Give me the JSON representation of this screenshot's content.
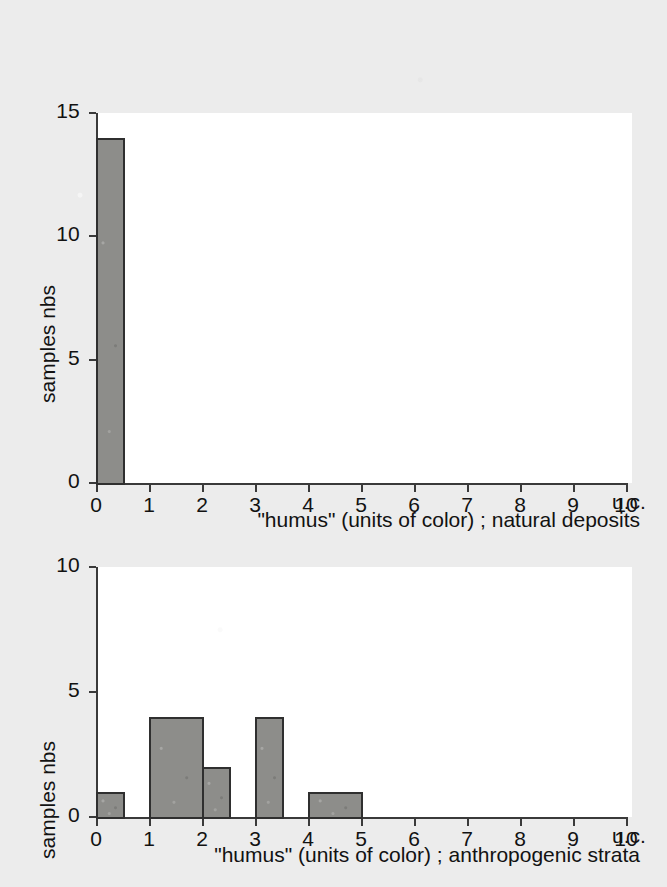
{
  "figure": {
    "background_color": "#ececec",
    "bar_fill_color": "#8d8d8a",
    "bar_edge_color": "#2f2f2f",
    "axis_color": "#3a3a3a"
  },
  "charts": [
    {
      "id": "natural-deposits",
      "ylabel": "samples nbs",
      "xlabel": "\"humus\" (units of color) ; natural deposits",
      "x_unit_suffix": "u.c.",
      "yticks": [
        "0",
        "5",
        "10",
        "15"
      ],
      "ytick_values": [
        0,
        5,
        10,
        15
      ],
      "xticks": [
        "0",
        "1",
        "2",
        "3",
        "4",
        "5",
        "6",
        "7",
        "8",
        "9",
        "10"
      ],
      "xtick_values": [
        0,
        1,
        2,
        3,
        4,
        5,
        6,
        7,
        8,
        9,
        10
      ],
      "bars": [
        {
          "x0": 0,
          "x1": 0.5,
          "value": 14
        }
      ]
    },
    {
      "id": "anthropogenic-strata",
      "ylabel": "samples nbs",
      "xlabel": "\"humus\" (units of color) ; anthropogenic strata",
      "x_unit_suffix": "u.c.",
      "yticks": [
        "0",
        "5",
        "10"
      ],
      "ytick_values": [
        0,
        5,
        10
      ],
      "xticks": [
        "0",
        "1",
        "2",
        "3",
        "4",
        "5",
        "6",
        "7",
        "8",
        "9",
        "10"
      ],
      "xtick_values": [
        0,
        1,
        2,
        3,
        4,
        5,
        6,
        7,
        8,
        9,
        10
      ],
      "bars": [
        {
          "x0": 0,
          "x1": 0.5,
          "value": 1
        },
        {
          "x0": 1,
          "x1": 2,
          "value": 4
        },
        {
          "x0": 2,
          "x1": 2.5,
          "value": 2
        },
        {
          "x0": 3,
          "x1": 3.5,
          "value": 4
        },
        {
          "x0": 4,
          "x1": 5,
          "value": 1
        }
      ]
    }
  ],
  "chart_data": [
    {
      "type": "bar",
      "title": "",
      "xlabel": "\"humus\" (units of color) ; natural deposits",
      "ylabel": "samples nbs",
      "xlim": [
        0,
        10
      ],
      "ylim": [
        0,
        15
      ],
      "grid": false,
      "legend": null,
      "x_unit": "u.c.",
      "xtick_labels": [
        "0",
        "1",
        "2",
        "3",
        "4",
        "5",
        "6",
        "7",
        "8",
        "9",
        "10"
      ],
      "ytick_labels": [
        "0",
        "5",
        "10",
        "15"
      ],
      "bin_edges": [
        0,
        0.5,
        1,
        2,
        2.5,
        3,
        3.5,
        4,
        5,
        6,
        7,
        8,
        9,
        10
      ],
      "categories": [
        "0-0.5",
        "0.5-1",
        "1-2",
        "2-2.5",
        "2.5-3",
        "3-3.5",
        "3.5-4",
        "4-5",
        "5-6",
        "6-7",
        "7-8",
        "8-9",
        "9-10"
      ],
      "values": [
        14,
        0,
        0,
        0,
        0,
        0,
        0,
        0,
        0,
        0,
        0,
        0,
        0
      ]
    },
    {
      "type": "bar",
      "title": "",
      "xlabel": "\"humus\" (units of color) ; anthropogenic strata",
      "ylabel": "samples nbs",
      "xlim": [
        0,
        10
      ],
      "ylim": [
        0,
        10
      ],
      "grid": false,
      "legend": null,
      "x_unit": "u.c.",
      "xtick_labels": [
        "0",
        "1",
        "2",
        "3",
        "4",
        "5",
        "6",
        "7",
        "8",
        "9",
        "10"
      ],
      "ytick_labels": [
        "0",
        "5",
        "10"
      ],
      "bin_edges": [
        0,
        0.5,
        1,
        2,
        2.5,
        3,
        3.5,
        4,
        5,
        6,
        7,
        8,
        9,
        10
      ],
      "categories": [
        "0-0.5",
        "0.5-1",
        "1-2",
        "2-2.5",
        "2.5-3",
        "3-3.5",
        "3.5-4",
        "4-5",
        "5-6",
        "6-7",
        "7-8",
        "8-9",
        "9-10"
      ],
      "values": [
        1,
        0,
        4,
        2,
        0,
        4,
        0,
        1,
        0,
        0,
        0,
        0,
        0
      ]
    }
  ]
}
